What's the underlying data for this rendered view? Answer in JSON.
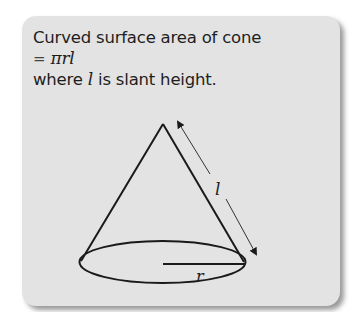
{
  "box": {
    "title": "Curved surface area of cone",
    "formula_eq": "=",
    "formula": "πrl",
    "note_prefix": "where",
    "note_var": "l",
    "note_suffix": "is slant height."
  },
  "diagram": {
    "shape": "cone",
    "slant_label": "l",
    "radius_label": "r"
  },
  "colors": {
    "card_background": "#e3e3e3",
    "stroke": "#1a1a1a",
    "text": "#1e1e1e"
  }
}
